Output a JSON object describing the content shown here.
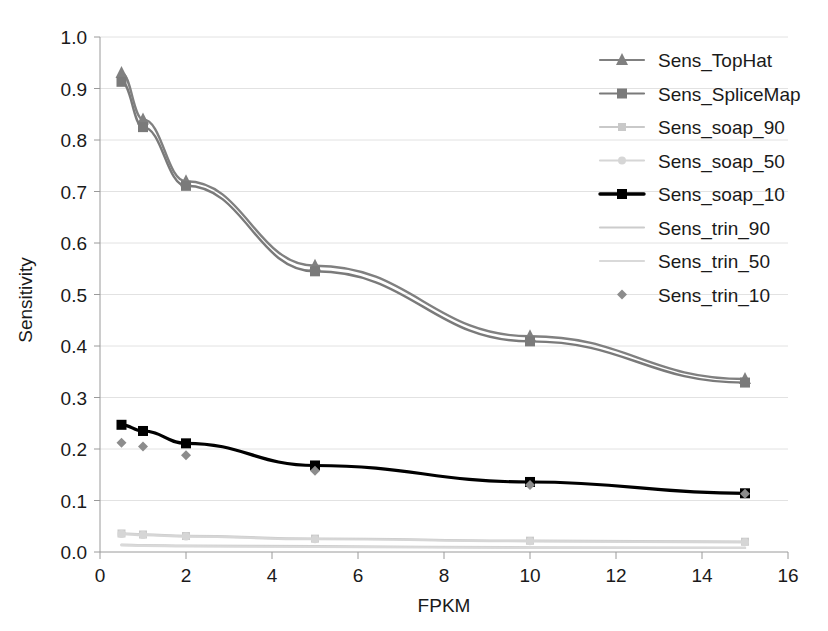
{
  "chart_data": {
    "type": "line",
    "title": "",
    "subtitle": "",
    "xlabel": "FPKM",
    "ylabel": "Sensitivity",
    "xlim": [
      0,
      16
    ],
    "ylim": [
      0.0,
      1.0
    ],
    "xticks": [
      0,
      2,
      4,
      6,
      8,
      10,
      12,
      14,
      16
    ],
    "xtick_labels": [
      "0",
      "2",
      "4",
      "6",
      "8",
      "10",
      "12",
      "14",
      "16"
    ],
    "yticks": [
      0.0,
      0.1,
      0.2,
      0.3,
      0.4,
      0.5,
      0.6,
      0.7,
      0.8,
      0.9,
      1.0
    ],
    "ytick_labels": [
      "0.0",
      "0.1",
      "0.2",
      "0.3",
      "0.4",
      "0.5",
      "0.6",
      "0.7",
      "0.8",
      "0.9",
      "1.0"
    ],
    "grid": true,
    "grid_axis": "y",
    "legend_position": "top-right",
    "x": [
      0.5,
      1,
      2,
      5,
      10,
      15
    ],
    "series": [
      {
        "name": "Sens_TopHat",
        "marker": "triangle",
        "color": "#808080",
        "line": true,
        "values": [
          0.93,
          0.84,
          0.72,
          0.556,
          0.419,
          0.336
        ]
      },
      {
        "name": "Sens_SpliceMap",
        "marker": "square",
        "color": "#7a7a7a",
        "line": true,
        "values": [
          0.913,
          0.825,
          0.711,
          0.545,
          0.409,
          0.329
        ]
      },
      {
        "name": "Sens_soap_90",
        "marker": "square",
        "color": "#c9c9c9",
        "line": true,
        "values": [
          0.036,
          0.034,
          0.031,
          0.026,
          0.022,
          0.02
        ]
      },
      {
        "name": "Sens_soap_50",
        "marker": "circle",
        "color": "#d6d6d6",
        "line": true,
        "values": [
          0.035,
          0.033,
          0.03,
          0.025,
          0.021,
          0.019
        ]
      },
      {
        "name": "Sens_soap_10",
        "marker": "square",
        "color": "#000000",
        "line": true,
        "values": [
          0.247,
          0.235,
          0.211,
          0.168,
          0.136,
          0.114
        ]
      },
      {
        "name": "Sens_trin_90",
        "marker": "none",
        "color": "#cccccc",
        "line": true,
        "values": [
          0.014,
          0.013,
          0.012,
          0.011,
          0.009,
          0.008
        ]
      },
      {
        "name": "Sens_trin_50",
        "marker": "none",
        "color": "#d9d9d9",
        "line": true,
        "values": [
          0.013,
          0.012,
          0.011,
          0.01,
          0.008,
          0.008
        ]
      },
      {
        "name": "Sens_trin_10",
        "marker": "diamond",
        "color": "#8c8c8c",
        "line": false,
        "values": [
          0.212,
          0.205,
          0.188,
          0.158,
          0.13,
          0.113
        ]
      }
    ]
  },
  "legend": {
    "items": [
      {
        "label": "Sens_TopHat"
      },
      {
        "label": "Sens_SpliceMap"
      },
      {
        "label": "Sens_soap_90"
      },
      {
        "label": "Sens_soap_50"
      },
      {
        "label": "Sens_soap_10"
      },
      {
        "label": "Sens_trin_90"
      },
      {
        "label": "Sens_trin_50"
      },
      {
        "label": "Sens_trin_10"
      }
    ]
  },
  "colors": {
    "background": "#ffffff",
    "axis": "#9a9a9a",
    "gridline": "#e2e2e2",
    "text": "#1a1a1a"
  }
}
